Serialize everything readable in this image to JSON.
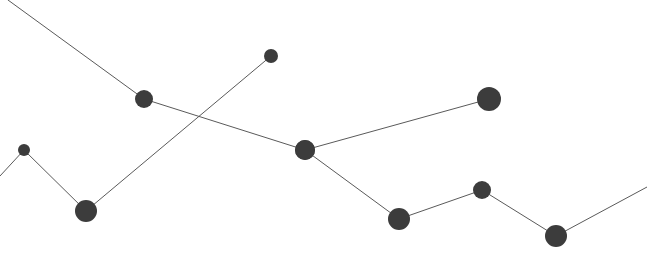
{
  "canvas": {
    "width": 647,
    "height": 269,
    "background": "#ffffff"
  },
  "style": {
    "line_color": "#5a5a5a",
    "line_width": 1,
    "node_color": "#3c3c3c",
    "node_edge_color": "#3c3c3c"
  },
  "chart_data": {
    "type": "line",
    "title": "",
    "subtitle": "",
    "xlabel": "",
    "ylabel": "",
    "xlim": [
      0,
      647
    ],
    "ylim": [
      0,
      269
    ],
    "grid": false,
    "axes_visible": false,
    "tick_labels_x": [],
    "tick_labels_y": [],
    "legend": {
      "visible": false,
      "position": "none",
      "entries": []
    },
    "annotations": [],
    "note": "Two unlabeled polylines with variable-size filled circular markers; lines cross near x=205,y=132. Coordinates are in pixel space with y measured downward from the top edge.",
    "series": [
      {
        "name": "series-a",
        "color": "#5a5a5a",
        "marker_color": "#3c3c3c",
        "points": [
          {
            "x": 8,
            "y": 0,
            "r": 0,
            "marker": false
          },
          {
            "x": 144,
            "y": 99,
            "r": 9,
            "marker": true
          },
          {
            "x": 305,
            "y": 150,
            "r": 10,
            "marker": true
          },
          {
            "x": 399,
            "y": 219,
            "r": 11,
            "marker": true
          },
          {
            "x": 482,
            "y": 190,
            "r": 9,
            "marker": true
          },
          {
            "x": 556,
            "y": 236,
            "r": 11,
            "marker": true
          },
          {
            "x": 647,
            "y": 187,
            "r": 0,
            "marker": false
          }
        ]
      },
      {
        "name": "series-b",
        "color": "#5a5a5a",
        "marker_color": "#3c3c3c",
        "points": [
          {
            "x": 0,
            "y": 176,
            "r": 0,
            "marker": false
          },
          {
            "x": 24,
            "y": 150,
            "r": 6,
            "marker": true
          },
          {
            "x": 86,
            "y": 211,
            "r": 11,
            "marker": true
          },
          {
            "x": 271,
            "y": 56,
            "r": 7,
            "marker": true
          }
        ]
      },
      {
        "name": "series-c",
        "color": "#5a5a5a",
        "marker_color": "#3c3c3c",
        "points": [
          {
            "x": 305,
            "y": 150,
            "r": 10,
            "marker": true
          },
          {
            "x": 489,
            "y": 99,
            "r": 12,
            "marker": true
          }
        ]
      }
    ]
  }
}
